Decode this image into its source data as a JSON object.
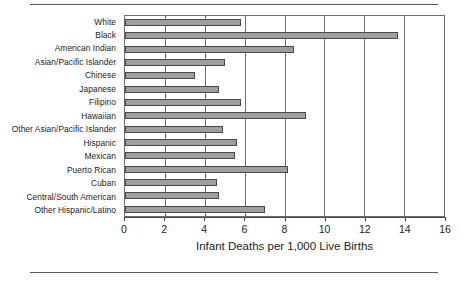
{
  "chart_data": {
    "type": "bar",
    "orientation": "horizontal",
    "title": "",
    "xlabel": "Infant Deaths per 1,000 Live Births",
    "ylabel": "",
    "xlim": [
      0,
      16
    ],
    "ylim": null,
    "grid": true,
    "legend": false,
    "xticks": [
      0,
      2,
      4,
      6,
      8,
      10,
      12,
      14,
      16
    ],
    "xticklabels": [
      "0",
      "2",
      "4",
      "6",
      "8",
      "10",
      "12",
      "14",
      "16"
    ],
    "bar_color": "#9e9e9e",
    "bar_edge_color": "#4a4a4a",
    "categories": [
      "White",
      "Black",
      "American Indian",
      "Asian/Pacific Islander",
      "Chinese",
      "Japanese",
      "Filipino",
      "Hawaiian",
      "Other Asian/Pacific Islander",
      "Hispanic",
      "Mexican",
      "Puerto Rican",
      "Cuban",
      "Central/South American",
      "Other Hispanic/Latino"
    ],
    "values": [
      5.8,
      13.7,
      8.5,
      5.0,
      3.5,
      4.7,
      5.8,
      9.1,
      4.9,
      5.6,
      5.5,
      8.2,
      4.6,
      4.7,
      7.0
    ]
  },
  "axis": {
    "x_title": "Infant Deaths per 1,000 Live Births"
  }
}
